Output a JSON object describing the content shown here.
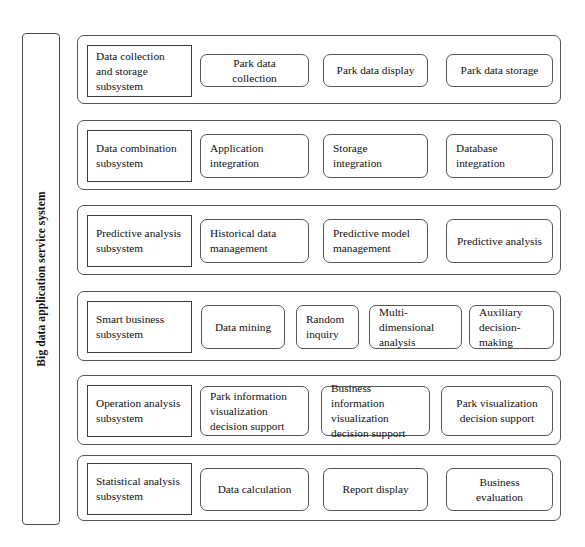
{
  "diagram": {
    "type": "hierarchy-block-diagram",
    "spine": {
      "label": "Big data application service system",
      "orientation": "vertical-rotated-90"
    },
    "rows": [
      {
        "subsystem": "Data collection and storage subsystem",
        "modules": [
          {
            "label": "Park data collection",
            "align": "center"
          },
          {
            "label": "Park data display",
            "align": "center"
          },
          {
            "label": "Park data storage",
            "align": "center"
          }
        ]
      },
      {
        "subsystem": "Data combination subsystem",
        "modules": [
          {
            "label": "Application integration",
            "align": "left"
          },
          {
            "label": "Storage integration",
            "align": "left"
          },
          {
            "label": "Database integration",
            "align": "left"
          }
        ]
      },
      {
        "subsystem": "Predictive analysis subsystem",
        "modules": [
          {
            "label": "Historical data management",
            "align": "left"
          },
          {
            "label": "Predictive model management",
            "align": "left"
          },
          {
            "label": "Predictive analysis",
            "align": "center"
          }
        ]
      },
      {
        "subsystem": "Smart business subsystem",
        "modules": [
          {
            "label": "Data mining",
            "align": "center"
          },
          {
            "label": "Random inquiry",
            "align": "left"
          },
          {
            "label": "Multi-dimensional analysis",
            "align": "left"
          },
          {
            "label": "Auxiliary decision-making",
            "align": "left"
          }
        ]
      },
      {
        "subsystem": "Operation analysis subsystem",
        "modules": [
          {
            "label": "Park information visualization decision support",
            "align": "left"
          },
          {
            "label": "Business information visualization decision support",
            "align": "left"
          },
          {
            "label": "Park visualization decision support",
            "align": "center"
          }
        ]
      },
      {
        "subsystem": "Statistical analysis subsystem",
        "modules": [
          {
            "label": "Data calculation",
            "align": "center"
          },
          {
            "label": "Report display",
            "align": "center"
          },
          {
            "label": "Business evaluation",
            "align": "center"
          }
        ]
      }
    ]
  },
  "style": {
    "page_background": "#ffffff",
    "border_color": "#555555",
    "subsystem_border_color": "#3d3d3d",
    "text_color": "#111111"
  },
  "geometry": {
    "bands": [
      {
        "top": 35,
        "height": 69
      },
      {
        "top": 120,
        "height": 70
      },
      {
        "top": 205,
        "height": 70
      },
      {
        "top": 291,
        "height": 70
      },
      {
        "top": 375,
        "height": 70
      },
      {
        "top": 455,
        "height": 66
      }
    ],
    "subsystem_box": {
      "left": 9,
      "top": 9,
      "width": 105,
      "height": 52
    },
    "module_sets": [
      [
        {
          "left": 122,
          "width": 109,
          "top": 14,
          "height": 33
        },
        {
          "left": 245,
          "width": 105,
          "top": 14,
          "height": 33
        },
        {
          "left": 368,
          "width": 107,
          "top": 14,
          "height": 33
        }
      ],
      [
        {
          "left": 122,
          "width": 109,
          "top": 12,
          "height": 44
        },
        {
          "left": 245,
          "width": 105,
          "top": 12,
          "height": 44
        },
        {
          "left": 368,
          "width": 107,
          "top": 12,
          "height": 44
        }
      ],
      [
        {
          "left": 122,
          "width": 109,
          "top": 12,
          "height": 44
        },
        {
          "left": 245,
          "width": 105,
          "top": 12,
          "height": 44
        },
        {
          "left": 368,
          "width": 107,
          "top": 12,
          "height": 44
        }
      ],
      [
        {
          "left": 123,
          "width": 84,
          "top": 12,
          "height": 44
        },
        {
          "left": 218,
          "width": 63,
          "top": 12,
          "height": 44
        },
        {
          "left": 291,
          "width": 93,
          "top": 12,
          "height": 44
        },
        {
          "left": 391,
          "width": 85,
          "top": 12,
          "height": 44
        }
      ],
      [
        {
          "left": 122,
          "width": 109,
          "top": 10,
          "height": 50
        },
        {
          "left": 243,
          "width": 109,
          "top": 10,
          "height": 50
        },
        {
          "left": 363,
          "width": 112,
          "top": 10,
          "height": 50
        }
      ],
      [
        {
          "left": 122,
          "width": 109,
          "top": 11,
          "height": 43
        },
        {
          "left": 245,
          "width": 105,
          "top": 11,
          "height": 43
        },
        {
          "left": 368,
          "width": 107,
          "top": 11,
          "height": 43
        }
      ]
    ]
  }
}
